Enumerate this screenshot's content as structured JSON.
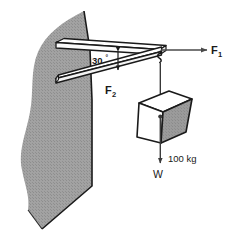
{
  "figure": {
    "background_color": "#ffffff"
  },
  "wall": {
    "name": "wall",
    "fill_color": "#9a9a9a",
    "edge_color": "#1a1a1a"
  },
  "beam": {
    "name": "horizontal-beam",
    "fill_color": "#ffffff",
    "edge_color": "#1a1a1a"
  },
  "strut": {
    "name": "diagonal-strut",
    "fill_color": "#ffffff",
    "edge_color": "#1a1a1a"
  },
  "block": {
    "name": "suspended-block",
    "top_face_color": "#ffffff",
    "front_face_color": "#ffffff",
    "side_face_color": "#9a9a9a",
    "edge_color": "#1a1a1a"
  },
  "labels": {
    "angle": "30",
    "angle_degree_symbol": "°",
    "force_1_base": "F",
    "force_1_sub": "1",
    "force_2_base": "F",
    "force_2_sub": "2",
    "mass": "100 kg",
    "weight": "W"
  },
  "arrows": {
    "f1_direction": "right",
    "weight_direction": "down",
    "angle_marker": "double-headed-vertical",
    "color": "#4a4a4a"
  }
}
